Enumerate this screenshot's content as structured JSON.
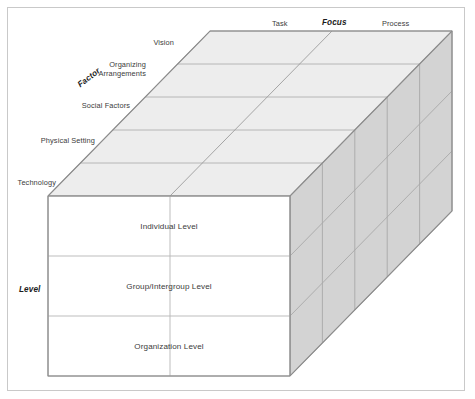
{
  "figure": {
    "title": "",
    "type": "3d-cube-matrix-diagram",
    "colors": {
      "frame_border": "#c9c9c9",
      "top_face": "#eeeeee",
      "right_face": "#d4d4d4",
      "front_face": "#ffffff",
      "edge_line": "#9a9a9a",
      "grid_line": "#b5b5b5",
      "text": "#3b3b3b",
      "axis_text": "#1c1c1c"
    }
  },
  "axes": {
    "focus": {
      "label": "Focus",
      "categories": [
        "Task",
        "Process"
      ]
    },
    "factor": {
      "label": "Factor",
      "categories": [
        "Vision",
        "Organizing\nArrangements",
        "Social Factors",
        "Physical Setting",
        "Technology"
      ],
      "categories_flat": [
        "Vision",
        "Organizing Arrangements",
        "Social Factors",
        "Physical Setting",
        "Technology"
      ]
    },
    "level": {
      "label": "Level",
      "categories": [
        "Individual Level",
        "Group/Intergroup Level",
        "Organization Level"
      ]
    }
  },
  "labels": {
    "focus_axis": "Focus",
    "focus_task": "Task",
    "focus_process": "Process",
    "factor_axis": "Factor",
    "factor_vision": "Vision",
    "factor_organizing_line1": "Organizing",
    "factor_organizing_line2": "Arrangements",
    "factor_social": "Social Factors",
    "factor_physical": "Physical Setting",
    "factor_technology": "Technology",
    "level_axis": "Level",
    "level_individual": "Individual Level",
    "level_group": "Group/Intergroup Level",
    "level_organization": "Organization Level"
  }
}
